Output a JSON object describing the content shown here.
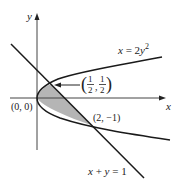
{
  "figure": {
    "type": "region between curves",
    "colors": {
      "curve": "#1a1a1a",
      "axis": "#444444",
      "shaded_region": "#b5b5b5",
      "background": "#ffffff"
    },
    "axes": {
      "x_label": "x",
      "y_label": "y",
      "origin_label": "(0, 0)"
    },
    "curves": [
      {
        "id": "parabola",
        "equation": "x = 2y",
        "exponent": "2"
      },
      {
        "id": "line",
        "equation": "x + y = 1"
      }
    ],
    "points": [
      {
        "id": "origin",
        "label": "(0, 0)"
      },
      {
        "id": "upper-intersection",
        "label_num": "1",
        "label_den": "2",
        "label": "(1/2, 1/2)"
      },
      {
        "id": "lower-intersection",
        "label": "(2, −1)"
      }
    ],
    "annotations": {
      "arrow_to_point": "upper-intersection"
    },
    "shaded_region": "region enclosed by x = 2y² and x + y = 1"
  }
}
